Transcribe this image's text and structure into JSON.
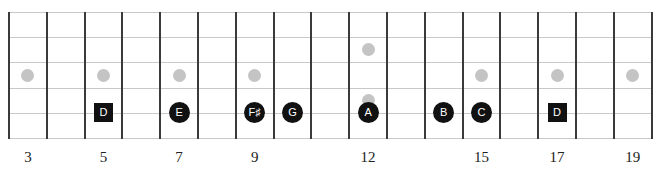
{
  "diagram": {
    "type": "guitar-fretboard",
    "strings": 6,
    "first_fret": 3,
    "last_fret": 19,
    "fret_labels": [
      {
        "fret": 3,
        "label": "3"
      },
      {
        "fret": 5,
        "label": "5"
      },
      {
        "fret": 7,
        "label": "7"
      },
      {
        "fret": 9,
        "label": "9"
      },
      {
        "fret": 12,
        "label": "12"
      },
      {
        "fret": 15,
        "label": "15"
      },
      {
        "fret": 17,
        "label": "17"
      },
      {
        "fret": 19,
        "label": "19"
      }
    ],
    "inlays": [
      {
        "fret": 3,
        "position": "middle"
      },
      {
        "fret": 5,
        "position": "middle"
      },
      {
        "fret": 7,
        "position": "middle"
      },
      {
        "fret": 9,
        "position": "middle"
      },
      {
        "fret": 12,
        "position": "upper"
      },
      {
        "fret": 12,
        "position": "lower"
      },
      {
        "fret": 15,
        "position": "middle"
      },
      {
        "fret": 17,
        "position": "middle"
      },
      {
        "fret": 19,
        "position": "middle"
      }
    ],
    "notes": [
      {
        "fret": 5,
        "string": 5,
        "label": "D",
        "shape": "square"
      },
      {
        "fret": 7,
        "string": 5,
        "label": "E",
        "shape": "circle"
      },
      {
        "fret": 9,
        "string": 5,
        "label": "F♯",
        "shape": "circle"
      },
      {
        "fret": 10,
        "string": 5,
        "label": "G",
        "shape": "circle"
      },
      {
        "fret": 12,
        "string": 5,
        "label": "A",
        "shape": "circle"
      },
      {
        "fret": 14,
        "string": 5,
        "label": "B",
        "shape": "circle"
      },
      {
        "fret": 15,
        "string": 5,
        "label": "C",
        "shape": "circle"
      },
      {
        "fret": 17,
        "string": 5,
        "label": "D",
        "shape": "square"
      }
    ],
    "colors": {
      "note_fill": "#111111",
      "note_text": "#ffffff",
      "inlay": "#c4c4c4",
      "fret_line": "#3a3a3a",
      "string_line": "#c8c8c8"
    }
  }
}
